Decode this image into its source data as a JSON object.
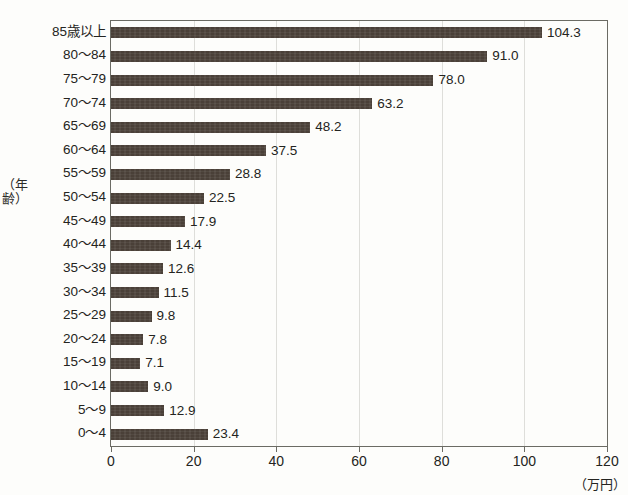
{
  "chart_data": {
    "type": "bar",
    "orientation": "horizontal",
    "title": "",
    "xlabel": "（万円）",
    "ylabel": "（年齢）",
    "xlim": [
      0,
      120
    ],
    "xticks": [
      "0",
      "20",
      "40",
      "60",
      "80",
      "100",
      "120"
    ],
    "grid": true,
    "legend": false,
    "bar_color": "#4a4038",
    "categories": [
      "85歳以上",
      "80〜84",
      "75〜79",
      "70〜74",
      "65〜69",
      "60〜64",
      "55〜59",
      "50〜54",
      "45〜49",
      "40〜44",
      "35〜39",
      "30〜34",
      "25〜29",
      "20〜24",
      "15〜19",
      "10〜14",
      "5〜9",
      "0〜4"
    ],
    "values": [
      104.3,
      91.0,
      78.0,
      63.2,
      48.2,
      37.5,
      28.8,
      22.5,
      17.9,
      14.4,
      12.6,
      11.5,
      9.8,
      7.8,
      7.1,
      9.0,
      12.9,
      23.4
    ],
    "value_labels": [
      "104.3",
      "91.0",
      "78.0",
      "63.2",
      "48.2",
      "37.5",
      "28.8",
      "22.5",
      "17.9",
      "14.4",
      "12.6",
      "11.5",
      "9.8",
      "7.8",
      "7.1",
      "9.0",
      "12.9",
      "23.4"
    ]
  }
}
